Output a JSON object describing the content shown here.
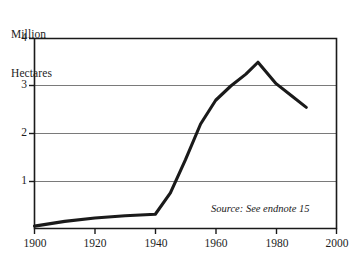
{
  "chart_data": {
    "type": "line",
    "title": "",
    "subtitle": "",
    "xlabel": "",
    "ylabel": "Million Hectares",
    "ylabel_lines": [
      "Million",
      "Hectares"
    ],
    "xlim": [
      1900,
      2000
    ],
    "ylim": [
      0,
      4
    ],
    "yticks": [
      0,
      1,
      2,
      3,
      4
    ],
    "ytick_labels": [
      "",
      "1",
      "2",
      "3",
      "4"
    ],
    "xticks": [
      1900,
      1920,
      1940,
      1960,
      1980,
      2000
    ],
    "xtick_labels": [
      "1900",
      "1920",
      "1940",
      "1960",
      "1980",
      "2000"
    ],
    "grid": "horizontal",
    "legend": "none",
    "annotations": [
      {
        "text": "Source: See endnote 15",
        "x": 1975,
        "y": 0.35,
        "style": "italic"
      }
    ],
    "series": [
      {
        "name": "Area",
        "color": "#1a1a1a",
        "x": [
          1900,
          1910,
          1920,
          1930,
          1940,
          1945,
          1950,
          1955,
          1960,
          1965,
          1970,
          1974,
          1980,
          1985,
          1990
        ],
        "values": [
          0.05,
          0.15,
          0.22,
          0.27,
          0.3,
          0.75,
          1.45,
          2.2,
          2.7,
          3.0,
          3.25,
          3.5,
          3.05,
          2.8,
          2.55
        ]
      }
    ]
  },
  "figure": {
    "source_note": "Source: See endnote 15",
    "axis_title_line1": "Million",
    "axis_title_line2": "Hectares",
    "ytick_4": "4",
    "ytick_3": "3",
    "ytick_2": "2",
    "ytick_1": "1",
    "xtick_1900": "1900",
    "xtick_1920": "1920",
    "xtick_1940": "1940",
    "xtick_1960": "1960",
    "xtick_1980": "1980",
    "xtick_2000": "2000",
    "line_color": "#1a1a1a",
    "grid_color": "#7a7a7a",
    "frame_color": "#1a1a1a"
  }
}
